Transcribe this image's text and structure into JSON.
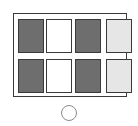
{
  "diagram": {
    "background_color": "#ffffff",
    "frame": {
      "label": "outer-frame",
      "stroke_color": "#3a3a3a",
      "fill_color": "#ffffff",
      "x": 13,
      "y": 13,
      "width": 114,
      "height": 84
    },
    "legend": {
      "dark_label": "dark-filled cell",
      "white_label": "unfilled cell",
      "light_label": "light-filled cell"
    },
    "palette": {
      "dark": "#6e6e6e",
      "white": "#ffffff",
      "light": "#e6e6e6",
      "stroke": "#3a3a3a",
      "circle_stroke": "#8a8a8a"
    },
    "grid": {
      "rows": 2,
      "columns": 4,
      "cells": [
        {
          "row": 0,
          "col": 0,
          "fill": "dark",
          "label": "R1C1"
        },
        {
          "row": 0,
          "col": 1,
          "fill": "white",
          "label": "R1C2"
        },
        {
          "row": 0,
          "col": 2,
          "fill": "dark",
          "label": "R1C3"
        },
        {
          "row": 0,
          "col": 3,
          "fill": "light",
          "label": "R1C4"
        },
        {
          "row": 1,
          "col": 0,
          "fill": "dark",
          "label": "R2C1"
        },
        {
          "row": 1,
          "col": 1,
          "fill": "white",
          "label": "R2C2"
        },
        {
          "row": 1,
          "col": 2,
          "fill": "dark",
          "label": "R2C3"
        },
        {
          "row": 1,
          "col": 3,
          "fill": "light",
          "label": "R2C4"
        }
      ]
    },
    "circle": {
      "label": "circle-marker",
      "stroke_color": "#8a8a8a",
      "cx": 69,
      "cy": 113,
      "r": 8
    }
  }
}
